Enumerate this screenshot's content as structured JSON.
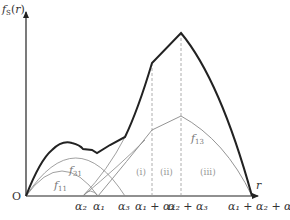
{
  "diagram": {
    "y_axis_label": {
      "main": "f",
      "sub": "S",
      "arg": "(r)"
    },
    "x_axis_label": "r",
    "origin_label": "O",
    "ticks": [
      {
        "id": "alpha2",
        "label": "α₂"
      },
      {
        "id": "alpha1",
        "label": "α₁"
      },
      {
        "id": "alpha3",
        "label": "α₃"
      },
      {
        "id": "alpha1_plus_alpha2",
        "label": "α₁ + α₂"
      },
      {
        "id": "alpha2_plus_alpha3",
        "label": "α₂ + α₃"
      },
      {
        "id": "alpha1_plus_alpha2_plus_alpha3",
        "label": "α₁ + α₂ + α₃"
      }
    ],
    "curve_labels": [
      {
        "id": "f11",
        "main": "f",
        "sub": "11"
      },
      {
        "id": "f31",
        "main": "f",
        "sub": "31"
      },
      {
        "id": "f13",
        "main": "f",
        "sub": "13"
      }
    ],
    "regions": [
      {
        "id": "region-i",
        "label": "(i)"
      },
      {
        "id": "region-ii",
        "label": "(ii)"
      },
      {
        "id": "region-iii",
        "label": "(iii)"
      }
    ],
    "colors": {
      "axis": "#222222",
      "thick_curve": "#222222",
      "thin_curve": "#888888",
      "dashed": "#999999"
    }
  }
}
